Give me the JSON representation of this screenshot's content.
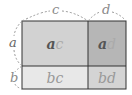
{
  "diagram": {
    "dimension_labels": {
      "top_left": "c",
      "top_right": "d",
      "left_top": "a",
      "left_bottom": "b"
    },
    "cells": [
      {
        "id": "ac",
        "first": "a",
        "second": "c",
        "fill": "#d2d2d2"
      },
      {
        "id": "ad",
        "first": "a",
        "second": "d",
        "fill": "#b6b6b6"
      },
      {
        "id": "bc",
        "first": "b",
        "second": "c",
        "fill": "#e8e8e8"
      },
      {
        "id": "bd",
        "first": "b",
        "second": "d",
        "fill": "#d4d4d4"
      }
    ]
  }
}
